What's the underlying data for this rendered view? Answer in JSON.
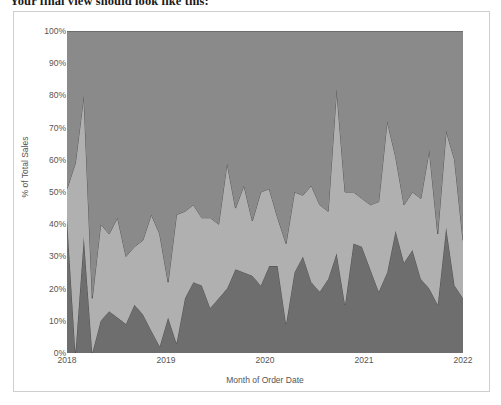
{
  "caption": "Your final view should look like this:",
  "chart": {
    "ylabel": "% of Total Sales",
    "xlabel": "Month of Order Date",
    "yticks": [
      "100%",
      "90%",
      "80%",
      "70%",
      "60%",
      "50%",
      "40%",
      "30%",
      "20%",
      "10%",
      "0%"
    ],
    "xticks": [
      "2018",
      "2019",
      "2020",
      "2021",
      "2022"
    ]
  },
  "colors": {
    "series_top": "#8a8a8a",
    "series_middle": "#b0b0b0",
    "series_bottom": "#6e6e6e",
    "outline": "#4a4a4a",
    "frame": "#cfcfcf",
    "axis_text": "#555555",
    "caption_text": "#1a1a1a",
    "background": "#ffffff"
  },
  "chart_data": {
    "type": "area",
    "title": "",
    "subtitle": "",
    "xlabel": "Month of Order Date",
    "ylabel": "% of Total Sales",
    "ylim": [
      0,
      100
    ],
    "stacked": "100%",
    "grid": false,
    "legend": "none",
    "axis_tick_labels": {
      "y": [
        "0%",
        "10%",
        "20%",
        "30%",
        "40%",
        "50%",
        "60%",
        "70%",
        "80%",
        "90%",
        "100%"
      ],
      "x": [
        "2018",
        "2019",
        "2020",
        "2021",
        "2022"
      ]
    },
    "x": [
      "2018-01",
      "2018-02",
      "2018-03",
      "2018-04",
      "2018-05",
      "2018-06",
      "2018-07",
      "2018-08",
      "2018-09",
      "2018-10",
      "2018-11",
      "2018-12",
      "2019-01",
      "2019-02",
      "2019-03",
      "2019-04",
      "2019-05",
      "2019-06",
      "2019-07",
      "2019-08",
      "2019-09",
      "2019-10",
      "2019-11",
      "2019-12",
      "2020-01",
      "2020-02",
      "2020-03",
      "2020-04",
      "2020-05",
      "2020-06",
      "2020-07",
      "2020-08",
      "2020-09",
      "2020-10",
      "2020-11",
      "2020-12",
      "2021-01",
      "2021-02",
      "2021-03",
      "2021-04",
      "2021-05",
      "2021-06",
      "2021-07",
      "2021-08",
      "2021-09",
      "2021-10",
      "2021-11",
      "2021-12"
    ],
    "series": [
      {
        "name": "bottom-band",
        "stack_order": 1,
        "color": "#6e6e6e",
        "values": [
          42,
          0,
          36,
          0,
          10,
          13,
          11,
          9,
          15,
          12,
          7,
          2,
          11,
          3,
          17,
          22,
          21,
          14,
          17,
          20,
          26,
          25,
          24,
          21,
          27,
          27,
          9,
          25,
          30,
          22,
          19,
          23,
          31,
          15,
          34,
          33,
          26,
          19,
          25,
          38,
          28,
          32,
          23,
          20,
          15,
          39,
          21,
          17
        ]
      },
      {
        "name": "middle-band",
        "stack_order": 2,
        "color": "#b0b0b0",
        "values": [
          9,
          59,
          44,
          17,
          30,
          24,
          31,
          21,
          18,
          23,
          36,
          35,
          11,
          40,
          27,
          24,
          21,
          28,
          23,
          39,
          19,
          27,
          17,
          29,
          24,
          15,
          25,
          25,
          19,
          30,
          27,
          21,
          51,
          35,
          16,
          15,
          20,
          28,
          47,
          23,
          18,
          18,
          25,
          43,
          22,
          30,
          39,
          18
        ]
      },
      {
        "name": "top-band",
        "stack_order": 3,
        "color": "#8a8a8a",
        "values": [
          49,
          41,
          20,
          83,
          60,
          63,
          58,
          70,
          67,
          65,
          57,
          63,
          78,
          57,
          56,
          54,
          58,
          58,
          60,
          41,
          55,
          48,
          59,
          50,
          49,
          58,
          66,
          50,
          51,
          48,
          54,
          56,
          18,
          50,
          50,
          52,
          54,
          53,
          28,
          39,
          54,
          50,
          52,
          37,
          63,
          31,
          40,
          65
        ]
      }
    ],
    "cumulative_upper_boundaries": {
      "bottom_plus_middle": [
        51,
        59,
        80,
        17,
        40,
        37,
        42,
        30,
        33,
        35,
        43,
        37,
        22,
        43,
        44,
        46,
        42,
        42,
        40,
        59,
        45,
        52,
        41,
        50,
        51,
        42,
        34,
        50,
        49,
        52,
        46,
        44,
        82,
        50,
        50,
        48,
        46,
        47,
        72,
        61,
        46,
        50,
        48,
        63,
        37,
        69,
        60,
        35
      ]
    }
  }
}
